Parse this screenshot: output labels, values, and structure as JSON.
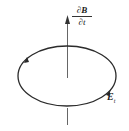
{
  "diagram": {
    "title": "",
    "axis_label": {
      "numerator_partial": "∂",
      "numerator_symbol": "B",
      "denominator": "∂t"
    },
    "field_label": {
      "symbol": "E",
      "subscript": "t"
    },
    "elements": [
      {
        "type": "vertical-arrow",
        "direction": "up",
        "meaning": "rate of change of magnetic field"
      },
      {
        "type": "elliptical-loop",
        "direction": "counterclockwise-arrows",
        "meaning": "induced electric field lines"
      }
    ],
    "colors": {
      "stroke": "#2b2b2b",
      "axis": "#555555",
      "background": "#ffffff"
    }
  }
}
